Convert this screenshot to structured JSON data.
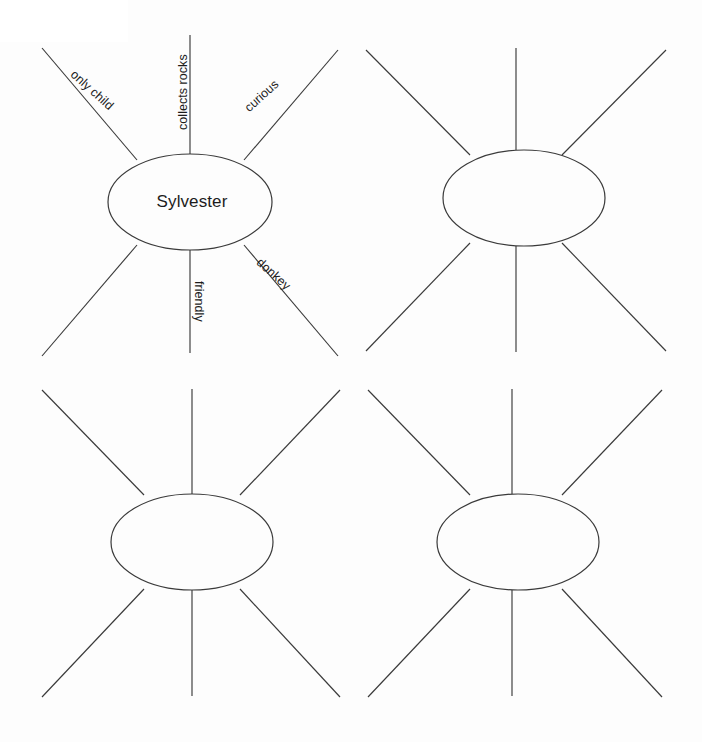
{
  "page": {
    "background_color": "#fdfdfd",
    "line_color": "#3a3a3a",
    "text_color": "#1c1c1c",
    "width": 702,
    "height": 742,
    "document_type": "word-web graphic organizer worksheet",
    "web_count": 4,
    "spokes_per_web": 6
  },
  "webs": [
    {
      "id": "web-1",
      "position": "top-left",
      "center_label": "Sylvester",
      "filled": true,
      "spokes": [
        {
          "id": "upper-left",
          "label": "only child",
          "rotation": 42,
          "filled": true
        },
        {
          "id": "up",
          "label": "collects rocks",
          "rotation": -90,
          "filled": true
        },
        {
          "id": "upper-right",
          "label": "curious",
          "rotation": -42,
          "filled": true
        },
        {
          "id": "lower-left",
          "label": "",
          "rotation": -42,
          "filled": false
        },
        {
          "id": "down",
          "label": "friendly",
          "rotation": 90,
          "filled": true
        },
        {
          "id": "lower-right",
          "label": "donkey",
          "rotation": 42,
          "filled": true
        }
      ]
    },
    {
      "id": "web-2",
      "position": "top-right",
      "center_label": "",
      "filled": false,
      "spokes": [
        {
          "id": "upper-left",
          "label": "",
          "rotation": 42,
          "filled": false
        },
        {
          "id": "up",
          "label": "",
          "rotation": -90,
          "filled": false
        },
        {
          "id": "upper-right",
          "label": "",
          "rotation": -42,
          "filled": false
        },
        {
          "id": "lower-left",
          "label": "",
          "rotation": -42,
          "filled": false
        },
        {
          "id": "down",
          "label": "",
          "rotation": 90,
          "filled": false
        },
        {
          "id": "lower-right",
          "label": "",
          "rotation": 42,
          "filled": false
        }
      ]
    },
    {
      "id": "web-3",
      "position": "bottom-left",
      "center_label": "",
      "filled": false,
      "spokes": [
        {
          "id": "upper-left",
          "label": "",
          "rotation": 42,
          "filled": false
        },
        {
          "id": "up",
          "label": "",
          "rotation": -90,
          "filled": false
        },
        {
          "id": "upper-right",
          "label": "",
          "rotation": -42,
          "filled": false
        },
        {
          "id": "lower-left",
          "label": "",
          "rotation": -42,
          "filled": false
        },
        {
          "id": "down",
          "label": "",
          "rotation": 90,
          "filled": false
        },
        {
          "id": "lower-right",
          "label": "",
          "rotation": 42,
          "filled": false
        }
      ]
    },
    {
      "id": "web-4",
      "position": "bottom-right",
      "center_label": "",
      "filled": false,
      "spokes": [
        {
          "id": "upper-left",
          "label": "",
          "rotation": 42,
          "filled": false
        },
        {
          "id": "up",
          "label": "",
          "rotation": -90,
          "filled": false
        },
        {
          "id": "upper-right",
          "label": "",
          "rotation": -42,
          "filled": false
        },
        {
          "id": "lower-left",
          "label": "",
          "rotation": -42,
          "filled": false
        },
        {
          "id": "down",
          "label": "",
          "rotation": 90,
          "filled": false
        },
        {
          "id": "lower-right",
          "label": "",
          "rotation": 42,
          "filled": false
        }
      ]
    }
  ]
}
